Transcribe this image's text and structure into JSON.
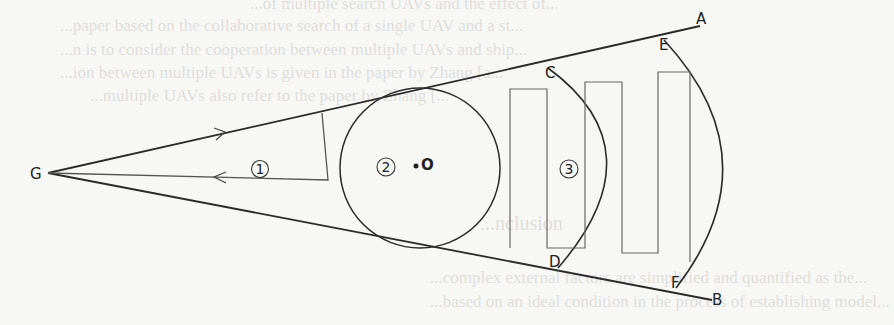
{
  "diagram": {
    "points": {
      "G": "G",
      "A": "A",
      "B": "B",
      "C": "C",
      "D": "D",
      "E": "E",
      "F": "F",
      "O": "O"
    },
    "regions": [
      {
        "id": "1",
        "label": "1",
        "description": "Triangular search loop near G"
      },
      {
        "id": "2",
        "label": "2",
        "description": "Circular region centered at O"
      },
      {
        "id": "3",
        "label": "3",
        "description": "Serpentine sweep between arcs CD and EF"
      }
    ],
    "colors": {
      "line": "#2a2a2a",
      "path": "#555555",
      "background": "#f7f7f5"
    }
  },
  "bleed_text": [
    "...of multiple search UAVs and the effect of...",
    "...paper based on the collaborative search of a single UAV and a st...",
    "...n is to consider the cooperation between multiple UAVs and ship...",
    "...ion between multiple UAVs is given in the paper by Zhang [a...",
    "...multiple UAVs also refer to the paper by Zhang [...",
    "...nclusion",
    "...complex external factors are simplified and quantified as the...",
    "...based on an ideal condition in the process of establishing model..."
  ]
}
